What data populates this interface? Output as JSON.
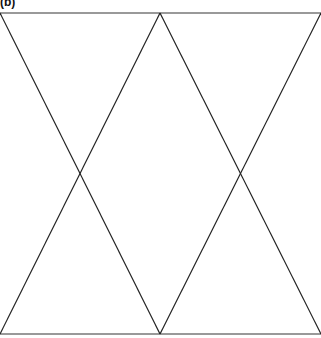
{
  "figure": {
    "label": "(b)",
    "width": 321,
    "height": 338,
    "colors": {
      "background": "#ffffff",
      "horizontal_lines": "#777777",
      "diagonal_lines": "#222222"
    },
    "horizontal_lines": [
      {
        "name": "top-edge",
        "x1": 0,
        "y1": 13,
        "x2": 321,
        "y2": 13
      },
      {
        "name": "bottom-edge",
        "x1": 0,
        "y1": 334,
        "x2": 321,
        "y2": 334
      }
    ],
    "diagonal_lines": [
      {
        "name": "diag-left-down",
        "x1": 0,
        "y1": 13,
        "x2": 160,
        "y2": 334
      },
      {
        "name": "diag-left-up",
        "x1": 160,
        "y1": 13,
        "x2": 0,
        "y2": 334
      },
      {
        "name": "diag-right-down",
        "x1": 160,
        "y1": 13,
        "x2": 321,
        "y2": 334
      },
      {
        "name": "diag-right-up",
        "x1": 321,
        "y1": 13,
        "x2": 160,
        "y2": 334
      }
    ]
  }
}
